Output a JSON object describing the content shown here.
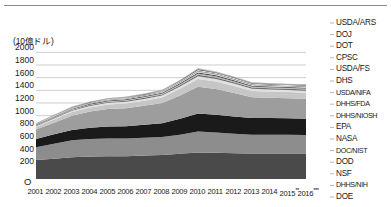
{
  "chart_data": {
    "type": "area",
    "title": "",
    "subtitle": "",
    "xlabel": "",
    "ylabel": "(10億ドル)",
    "unit_note": "(10億ドル)",
    "stacked": true,
    "grid": true,
    "legend_position": "right",
    "ylim": [
      0,
      2100
    ],
    "yticks": [
      0,
      200,
      400,
      600,
      800,
      1000,
      1200,
      1400,
      1600,
      1800,
      2000
    ],
    "ytick_labels": [
      "O",
      "200",
      "400",
      "600",
      "800",
      "1000",
      "1200",
      "1400",
      "1600",
      "1800",
      "2000"
    ],
    "zero_label": "O",
    "categories": [
      "2001",
      "2002",
      "2003",
      "2004",
      "2005",
      "2006",
      "2007",
      "2008",
      "2009",
      "2010",
      "2011",
      "2012",
      "2013",
      "2014",
      "2015",
      "2016"
    ],
    "category_marks": {
      "2015": "**",
      "2016": "***"
    },
    "series": [
      {
        "name": "DOE",
        "color": "#4a4a4a",
        "values": [
          300,
          320,
          345,
          355,
          360,
          360,
          370,
          380,
          400,
          420,
          415,
          405,
          400,
          400,
          400,
          400
        ]
      },
      {
        "name": "DHHS/NIH",
        "color": "#8d8d8d",
        "values": [
          200,
          235,
          265,
          275,
          280,
          278,
          280,
          285,
          300,
          330,
          320,
          310,
          300,
          300,
          298,
          295
        ]
      },
      {
        "name": "NSF",
        "color": "#1a1a1a",
        "values": [
          130,
          150,
          165,
          180,
          190,
          195,
          205,
          215,
          250,
          285,
          280,
          272,
          265,
          262,
          260,
          258
        ]
      },
      {
        "name": "DOD",
        "color": "#9d9d9d",
        "values": [
          150,
          185,
          225,
          255,
          275,
          285,
          300,
          320,
          370,
          420,
          405,
          370,
          325,
          320,
          318,
          315
        ]
      },
      {
        "name": "DOC/NIST",
        "color": "#c6c6c6",
        "values": [
          40,
          48,
          58,
          65,
          72,
          76,
          82,
          88,
          105,
          125,
          120,
          112,
          100,
          98,
          96,
          95
        ]
      },
      {
        "name": "NASA",
        "color": "#e0e0e0",
        "values": [
          14,
          17,
          20,
          23,
          25,
          26,
          28,
          30,
          35,
          42,
          40,
          37,
          34,
          33,
          33,
          32
        ]
      },
      {
        "name": "EPA",
        "color": "#6e6e6e",
        "values": [
          10,
          11,
          13,
          14,
          15,
          16,
          17,
          18,
          21,
          25,
          24,
          22,
          20,
          20,
          19,
          19
        ]
      },
      {
        "name": "DHHS/NIOSH",
        "color": "#b5b5b5",
        "values": [
          8,
          9,
          10,
          11,
          12,
          12,
          13,
          14,
          16,
          19,
          18,
          17,
          16,
          15,
          15,
          15
        ]
      },
      {
        "name": "DHHS/FDA",
        "color": "#3a3a3a",
        "values": [
          7,
          8,
          9,
          10,
          10,
          11,
          11,
          12,
          14,
          17,
          16,
          15,
          14,
          14,
          13,
          13
        ]
      },
      {
        "name": "USDA/NIFA",
        "color": "#d4d4d4",
        "values": [
          6,
          7,
          8,
          8,
          9,
          9,
          10,
          10,
          12,
          15,
          14,
          13,
          12,
          12,
          12,
          12
        ]
      },
      {
        "name": "DHS",
        "color": "#757575",
        "values": [
          5,
          6,
          7,
          7,
          8,
          8,
          9,
          9,
          11,
          13,
          12,
          11,
          10,
          10,
          10,
          10
        ]
      },
      {
        "name": "USDA/FS",
        "color": "#ededed",
        "values": [
          4,
          5,
          5,
          6,
          6,
          7,
          7,
          8,
          9,
          11,
          10,
          10,
          9,
          9,
          9,
          9
        ]
      },
      {
        "name": "CPSC",
        "color": "#2b2b2b",
        "values": [
          3,
          4,
          4,
          5,
          5,
          5,
          6,
          6,
          7,
          9,
          8,
          8,
          7,
          7,
          7,
          7
        ]
      },
      {
        "name": "DOT",
        "color": "#a8a8a8",
        "values": [
          3,
          3,
          4,
          4,
          4,
          5,
          5,
          5,
          6,
          8,
          7,
          7,
          6,
          6,
          6,
          6
        ]
      },
      {
        "name": "DOJ",
        "color": "#5c5c5c",
        "values": [
          2,
          3,
          3,
          3,
          4,
          4,
          4,
          4,
          5,
          6,
          6,
          5,
          5,
          5,
          5,
          5
        ]
      },
      {
        "name": "USDA/ARS",
        "color": "#cfcfcf",
        "values": [
          2,
          2,
          3,
          3,
          3,
          3,
          4,
          4,
          5,
          6,
          5,
          5,
          4,
          4,
          4,
          4
        ]
      }
    ],
    "legend_entries": [
      "USDA/ARS",
      "DOJ",
      "DOT",
      "CPSC",
      "USDA/FS",
      "DHS",
      "USDA/NIFA",
      "DHHS/FDA",
      "DHHS/NIOSH",
      "EPA",
      "NASA",
      "DOC/NIST",
      "DOD",
      "NSF",
      "DHHS/NIH",
      "DOE"
    ]
  }
}
